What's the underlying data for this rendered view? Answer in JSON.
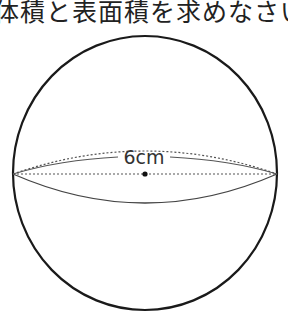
{
  "question": {
    "text": "体積と表面積を求めなさい"
  },
  "figure": {
    "shape": "sphere",
    "diameter_label": "6cm",
    "stroke_color": "#1a1a1a",
    "center": [
      145,
      173
    ],
    "radius": 134
  }
}
